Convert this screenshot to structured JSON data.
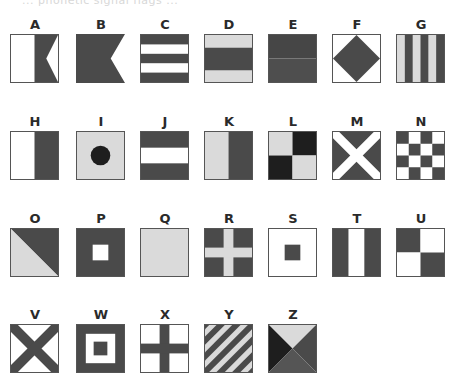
{
  "page": {
    "cutoff_header": "... phonetic signal flags ..."
  },
  "colors": {
    "white": "#ffffff",
    "light": "#dadada",
    "dark": "#4a4a4a",
    "black": "#1e1e1e",
    "border": "#555555"
  },
  "flags": [
    {
      "letter": "A",
      "pattern": "swallowtail-split"
    },
    {
      "letter": "B",
      "pattern": "swallowtail-solid"
    },
    {
      "letter": "C",
      "pattern": "five-horizontal-stripes"
    },
    {
      "letter": "D",
      "pattern": "horizontal-band-center"
    },
    {
      "letter": "E",
      "pattern": "horizontal-halves-dark"
    },
    {
      "letter": "F",
      "pattern": "diamond"
    },
    {
      "letter": "G",
      "pattern": "six-vertical-stripes"
    },
    {
      "letter": "H",
      "pattern": "vertical-halves-white-dark"
    },
    {
      "letter": "I",
      "pattern": "circle-on-light"
    },
    {
      "letter": "J",
      "pattern": "three-horizontal-stripes"
    },
    {
      "letter": "K",
      "pattern": "vertical-halves-light-dark"
    },
    {
      "letter": "L",
      "pattern": "quarters-light-black"
    },
    {
      "letter": "M",
      "pattern": "saltire-white-on-dark"
    },
    {
      "letter": "N",
      "pattern": "checkerboard"
    },
    {
      "letter": "O",
      "pattern": "diagonal-halves"
    },
    {
      "letter": "P",
      "pattern": "dark-with-white-square"
    },
    {
      "letter": "Q",
      "pattern": "solid-light"
    },
    {
      "letter": "R",
      "pattern": "cross-light-on-dark"
    },
    {
      "letter": "S",
      "pattern": "white-with-dark-square"
    },
    {
      "letter": "T",
      "pattern": "vertical-tricolor"
    },
    {
      "letter": "U",
      "pattern": "quarters-dark-white"
    },
    {
      "letter": "V",
      "pattern": "saltire-dark-on-white"
    },
    {
      "letter": "W",
      "pattern": "nested-squares"
    },
    {
      "letter": "X",
      "pattern": "cross-dark-on-white"
    },
    {
      "letter": "Y",
      "pattern": "diagonal-stripes"
    },
    {
      "letter": "Z",
      "pattern": "four-triangles"
    }
  ]
}
